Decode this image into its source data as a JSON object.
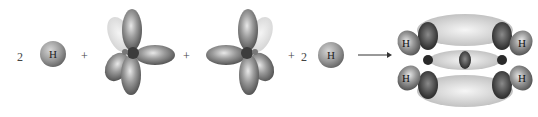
{
  "equation": {
    "terms": [
      {
        "type": "coefficient",
        "value": "2"
      },
      {
        "type": "atom",
        "label": "H"
      },
      {
        "type": "operator",
        "value": "+"
      },
      {
        "type": "orbital",
        "name": "sp2-carbon-left"
      },
      {
        "type": "operator",
        "value": "+"
      },
      {
        "type": "orbital",
        "name": "sp2-carbon-right"
      },
      {
        "type": "operator",
        "value": "+"
      },
      {
        "type": "coefficient",
        "value": "2"
      },
      {
        "type": "atom",
        "label": "H"
      },
      {
        "type": "arrow",
        "value": "→"
      },
      {
        "type": "product",
        "name": "ethylene-molecular-orbitals"
      }
    ],
    "coef1": "2",
    "atom1": "H",
    "plus1": "+",
    "plus2": "+",
    "plus3": "+",
    "coef2": "2",
    "atom2": "H",
    "product_labels": [
      "H",
      "H",
      "H",
      "H"
    ]
  },
  "colors": {
    "lobe_dark": "#4a4a4a",
    "lobe_mid": "#8c8c8c",
    "lobe_light": "#d9d9d9",
    "background": "#ffffff"
  }
}
